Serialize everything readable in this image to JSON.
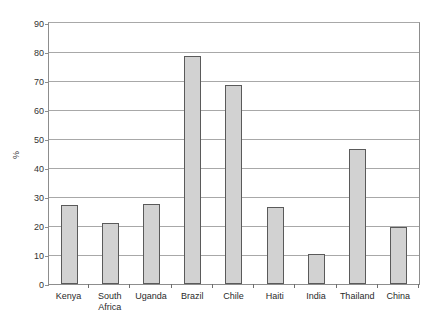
{
  "chart_data": {
    "type": "bar",
    "title": "",
    "subtitle": "",
    "xlabel": "",
    "ylabel": "%",
    "ylim": [
      0,
      90
    ],
    "ytick_step": 10,
    "yticks": [
      0,
      10,
      20,
      30,
      40,
      50,
      60,
      70,
      80,
      90
    ],
    "ytick_labels": [
      "0",
      "10",
      "20",
      "30",
      "40",
      "50",
      "60",
      "70",
      "80",
      "90"
    ],
    "grid": "horizontal",
    "legend": "none",
    "categories": [
      "Kenya",
      "South Africa",
      "Uganda",
      "Brazil",
      "Chile",
      "Haiti",
      "India",
      "Thailand",
      "China"
    ],
    "category_lines": [
      [
        "Kenya"
      ],
      [
        "South",
        "Africa"
      ],
      [
        "Uganda"
      ],
      [
        "Brazil"
      ],
      [
        "Chile"
      ],
      [
        "Haiti"
      ],
      [
        "India"
      ],
      [
        "Thailand"
      ],
      [
        "China"
      ]
    ],
    "values": [
      27.4,
      21.2,
      27.6,
      78.5,
      68.7,
      26.5,
      10.4,
      46.5,
      19.6
    ],
    "bar_fill_color": "#d2d2d2",
    "bar_edge_color": "#5a5a5a",
    "gridline_color": "#a8a8a8",
    "axis_color": "#8d8d8d",
    "background_color": "#ffffff"
  }
}
